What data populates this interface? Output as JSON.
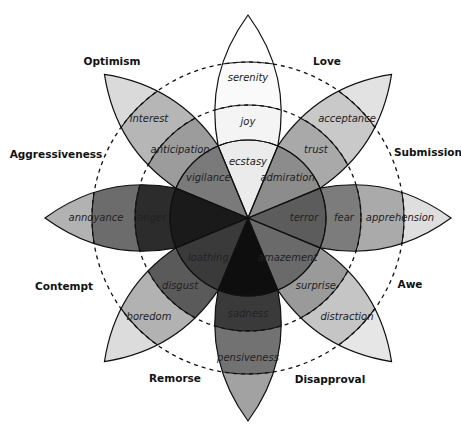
{
  "diagram": {
    "center": [
      248,
      218
    ],
    "radii": {
      "inner": 78,
      "middle": 113,
      "outer": 156,
      "tip": 203
    },
    "label_radii": {
      "inner": 56,
      "middle": 96,
      "outer": 140
    },
    "petals": [
      {
        "angle": -90,
        "inner": "ecstasy",
        "middle": "joy",
        "outer": "serenity",
        "colors": {
          "inner": "#ebebeb",
          "middle": "#f4f4f4",
          "outer": "#fafafa",
          "tip": "#ffffff"
        }
      },
      {
        "angle": -45,
        "inner": "admiration",
        "middle": "trust",
        "outer": "acceptance",
        "colors": {
          "inner": "#8c8c8c",
          "middle": "#a9a9a9",
          "outer": "#c9c9c9",
          "tip": "#e2e2e2"
        }
      },
      {
        "angle": 0,
        "inner": "terror",
        "middle": "fear",
        "outer": "apprehension",
        "colors": {
          "inner": "#5c5c5c",
          "middle": "#7c7c7c",
          "outer": "#aaaaaa",
          "tip": "#dedede"
        }
      },
      {
        "angle": 45,
        "inner": "amazement",
        "middle": "surprise",
        "outer": "distraction",
        "colors": {
          "inner": "#6a6a6a",
          "middle": "#9a9a9a",
          "outer": "#c5c5c5",
          "tip": "#e6e6e6"
        }
      },
      {
        "angle": 90,
        "inner": "",
        "middle": "sadness",
        "outer": "pensiveness",
        "colors": {
          "inner": "#0e0e0e",
          "middle": "#3a3a3a",
          "outer": "#727272",
          "tip": "#a2a2a2"
        }
      },
      {
        "angle": 135,
        "inner": "loathing",
        "middle": "disgust",
        "outer": "boredom",
        "colors": {
          "inner": "#3a3a3a",
          "middle": "#5a5a5a",
          "outer": "#b2b2b2",
          "tip": "#dcdcdc"
        }
      },
      {
        "angle": 180,
        "inner": "",
        "middle": "anger",
        "outer": "annoyance",
        "colors": {
          "inner": "#1a1a1a",
          "middle": "#2c2c2c",
          "outer": "#6c6c6c",
          "tip": "#b2b2b2"
        }
      },
      {
        "angle": -135,
        "inner": "vigilance",
        "middle": "anticipation",
        "outer": "interest",
        "colors": {
          "inner": "#7a7a7a",
          "middle": "#9c9c9c",
          "outer": "#b6b6b6",
          "tip": "#dadada"
        }
      }
    ],
    "dyads": [
      {
        "label": "Optimism",
        "x": 112,
        "y": 62
      },
      {
        "label": "Love",
        "x": 327,
        "y": 62
      },
      {
        "label": "Aggressiveness",
        "x": 56,
        "y": 155
      },
      {
        "label": "Submission",
        "x": 428,
        "y": 153
      },
      {
        "label": "Contempt",
        "x": 64,
        "y": 287
      },
      {
        "label": "Awe",
        "x": 410,
        "y": 285
      },
      {
        "label": "Remorse",
        "x": 175,
        "y": 379
      },
      {
        "label": "Disapproval",
        "x": 330,
        "y": 380
      }
    ]
  }
}
